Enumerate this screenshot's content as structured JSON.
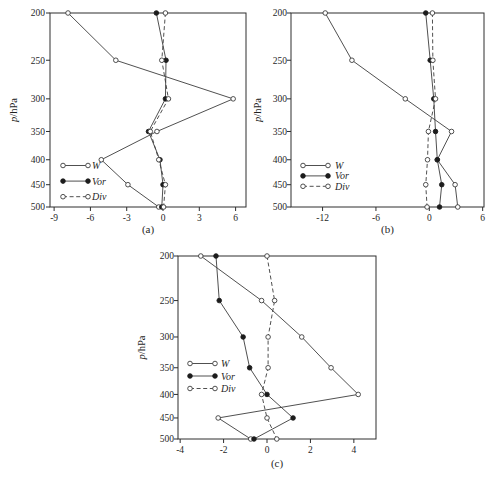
{
  "page": {
    "background": "#ffffff",
    "ink_color": "#2e2e2e"
  },
  "ylabel": {
    "italic_part": "p",
    "rest_part": "/hPa"
  },
  "pressure_levels": [
    200,
    250,
    300,
    350,
    400,
    450,
    500
  ],
  "chart_data": [
    {
      "id": "a",
      "type": "line",
      "caption": "(a)",
      "ylabel": "p/hPa",
      "y_scale": "log",
      "y_ticks": [
        200,
        250,
        300,
        350,
        400,
        450,
        500
      ],
      "y_range": [
        200,
        500
      ],
      "x_ticks": [
        -9,
        -6,
        -3,
        0,
        3,
        6
      ],
      "x_range": [
        -9.34,
        6.86
      ],
      "grid": false,
      "legend": {
        "position": "lower-left",
        "items": [
          "W",
          "Vor",
          "Div"
        ]
      },
      "categories": [
        200,
        250,
        300,
        350,
        400,
        450,
        500
      ],
      "series": [
        {
          "name": "W",
          "line": "solid",
          "marker": "open",
          "values": [
            -7.85,
            -3.9,
            5.8,
            -0.5,
            -5.1,
            -2.9,
            -0.35
          ]
        },
        {
          "name": "Vor",
          "line": "solid",
          "marker": "filled",
          "values": [
            -0.55,
            0.25,
            0.2,
            -1.2,
            -0.25,
            0.0,
            -0.1
          ]
        },
        {
          "name": "Div",
          "line": "dashed",
          "marker": "open",
          "values": [
            0.2,
            -0.1,
            0.45,
            -1.05,
            -0.35,
            0.2,
            0.05
          ]
        }
      ]
    },
    {
      "id": "b",
      "type": "line",
      "caption": "(b)",
      "ylabel": "p/hPa",
      "y_scale": "log",
      "y_ticks": [
        200,
        250,
        300,
        350,
        400,
        450,
        500
      ],
      "y_range": [
        200,
        500
      ],
      "x_ticks": [
        -12,
        -6,
        0,
        6
      ],
      "x_range": [
        -15.55,
        6.15
      ],
      "grid": false,
      "legend": {
        "position": "lower-left",
        "items": [
          "W",
          "Vor",
          "Div"
        ]
      },
      "categories": [
        200,
        250,
        300,
        350,
        400,
        450,
        500
      ],
      "series": [
        {
          "name": "W",
          "line": "solid",
          "marker": "open",
          "values": [
            -11.7,
            -8.7,
            -2.7,
            2.5,
            0.9,
            2.9,
            3.2
          ]
        },
        {
          "name": "Vor",
          "line": "solid",
          "marker": "filled",
          "values": [
            -0.4,
            0.1,
            0.5,
            0.7,
            0.9,
            1.4,
            1.15
          ]
        },
        {
          "name": "Div",
          "line": "dashed",
          "marker": "open",
          "values": [
            0.35,
            0.4,
            0.7,
            -0.1,
            -0.2,
            -0.4,
            -0.25
          ]
        }
      ]
    },
    {
      "id": "c",
      "type": "line",
      "caption": "(c)",
      "ylabel": "p/hPa",
      "y_scale": "log",
      "y_ticks": [
        200,
        250,
        300,
        350,
        400,
        450,
        500
      ],
      "y_range": [
        200,
        500
      ],
      "x_ticks": [
        -4,
        -2,
        0,
        2,
        4
      ],
      "x_range": [
        -4.1,
        5.02
      ],
      "grid": false,
      "legend": {
        "position": "center-left",
        "items": [
          "W",
          "Vor",
          "Div"
        ]
      },
      "categories": [
        200,
        250,
        300,
        350,
        400,
        450,
        500
      ],
      "series": [
        {
          "name": "W",
          "line": "solid",
          "marker": "open",
          "values": [
            -3.05,
            -0.25,
            1.6,
            2.95,
            4.2,
            -2.25,
            -0.75
          ]
        },
        {
          "name": "Vor",
          "line": "solid",
          "marker": "filled",
          "values": [
            -2.35,
            -2.2,
            -1.1,
            -0.8,
            0.0,
            1.2,
            -0.6
          ]
        },
        {
          "name": "Div",
          "line": "dashed",
          "marker": "open",
          "values": [
            0.0,
            0.35,
            0.05,
            0.05,
            -0.25,
            0.0,
            0.45
          ]
        }
      ]
    }
  ]
}
